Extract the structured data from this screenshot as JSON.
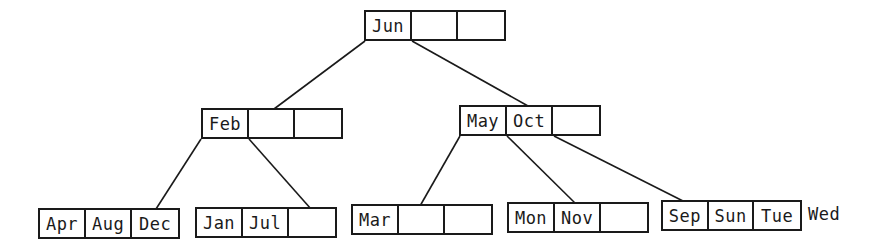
{
  "diagram": {
    "type": "b-tree",
    "root": {
      "keys": [
        "Jun",
        "",
        ""
      ]
    },
    "level1": [
      {
        "keys": [
          "Feb",
          "",
          ""
        ]
      },
      {
        "keys": [
          "May",
          "Oct",
          ""
        ]
      }
    ],
    "leaves": [
      {
        "keys": [
          "Apr",
          "Aug",
          "Dec"
        ]
      },
      {
        "keys": [
          "Jan",
          "Jul",
          ""
        ]
      },
      {
        "keys": [
          "Mar",
          "",
          ""
        ]
      },
      {
        "keys": [
          "Mon",
          "Nov",
          ""
        ]
      },
      {
        "keys": [
          "Sep",
          "Sun",
          "Tue"
        ]
      }
    ],
    "overflow_key": "Wed"
  }
}
